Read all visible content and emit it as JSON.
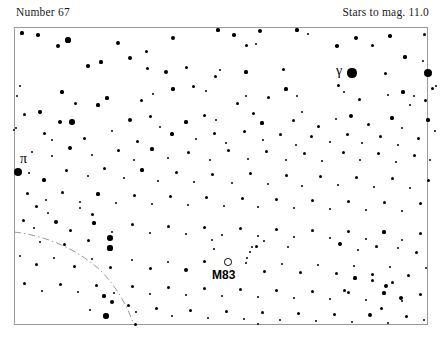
{
  "header": {
    "left": "Number 67",
    "right": "Stars to mag. 11.0"
  },
  "chart": {
    "frame": {
      "x": 14,
      "y": 27,
      "width": 414,
      "height": 298
    },
    "border_color": "#9a9a9a",
    "background": "#ffffff",
    "star_color": "#000000",
    "boundary_color": "#9a9a9a"
  },
  "labels": [
    {
      "name": "pi",
      "text": "π",
      "x": 20,
      "y": 152
    },
    {
      "name": "gamma",
      "text": "γ",
      "x": 336,
      "y": 64
    },
    {
      "name": "m83",
      "text": "M83",
      "x": 212,
      "y": 269
    }
  ],
  "deep_sky_objects": [
    {
      "name": "M83",
      "marker": "open-circle",
      "x": 228,
      "y": 262,
      "d": 7.5
    }
  ],
  "boundary_path": "M 14,232 C 48,236 78,250 100,270 C 118,288 128,308 134,325",
  "stars": [
    [
      22,
      33,
      1.6
    ],
    [
      38,
      35,
      1.7
    ],
    [
      58,
      46,
      2.3
    ],
    [
      68,
      40,
      2.6
    ],
    [
      118,
      43,
      2.0
    ],
    [
      146,
      51,
      1.5
    ],
    [
      173,
      38,
      2.1
    ],
    [
      218,
      30,
      1.6
    ],
    [
      234,
      35,
      1.7
    ],
    [
      246,
      45,
      1.5
    ],
    [
      256,
      44,
      1.3
    ],
    [
      260,
      31,
      2.4
    ],
    [
      297,
      30,
      1.6
    ],
    [
      308,
      34,
      1.4
    ],
    [
      337,
      46,
      1.8
    ],
    [
      356,
      38,
      2.0
    ],
    [
      372,
      45,
      1.5
    ],
    [
      390,
      36,
      1.8
    ],
    [
      405,
      57,
      1.6
    ],
    [
      424,
      34,
      1.5
    ],
    [
      20,
      86,
      1.4
    ],
    [
      88,
      66,
      1.8
    ],
    [
      101,
      62,
      1.6
    ],
    [
      130,
      58,
      2.0
    ],
    [
      147,
      68,
      1.5
    ],
    [
      166,
      72,
      2.2
    ],
    [
      186,
      67,
      1.5
    ],
    [
      215,
      76,
      1.5
    ],
    [
      220,
      70,
      1.3
    ],
    [
      246,
      72,
      1.6
    ],
    [
      283,
      69,
      1.5
    ],
    [
      352,
      73,
      4.6
    ],
    [
      385,
      73,
      1.5
    ],
    [
      428,
      73,
      4.3
    ],
    [
      423,
      61,
      1.4
    ],
    [
      432,
      88,
      1.5
    ],
    [
      17,
      96,
      1.4
    ],
    [
      40,
      112,
      1.7
    ],
    [
      62,
      92,
      1.6
    ],
    [
      75,
      103,
      1.5
    ],
    [
      107,
      98,
      1.6
    ],
    [
      141,
      100,
      1.5
    ],
    [
      153,
      94,
      1.4
    ],
    [
      173,
      89,
      1.6
    ],
    [
      193,
      86,
      1.5
    ],
    [
      206,
      91,
      1.4
    ],
    [
      237,
      103,
      1.5
    ],
    [
      246,
      96,
      1.3
    ],
    [
      268,
      97,
      1.5
    ],
    [
      286,
      89,
      1.6
    ],
    [
      297,
      96,
      1.4
    ],
    [
      338,
      85,
      1.5
    ],
    [
      344,
      92,
      1.4
    ],
    [
      359,
      99,
      1.5
    ],
    [
      388,
      95,
      1.4
    ],
    [
      403,
      92,
      1.6
    ],
    [
      410,
      105,
      1.4
    ],
    [
      414,
      96,
      1.3
    ],
    [
      425,
      100,
      1.5
    ],
    [
      436,
      86,
      1.4
    ],
    [
      24,
      114,
      1.5
    ],
    [
      60,
      122,
      2.4
    ],
    [
      72,
      122,
      2.8
    ],
    [
      98,
      105,
      1.6
    ],
    [
      130,
      120,
      2.3
    ],
    [
      150,
      116,
      1.5
    ],
    [
      160,
      127,
      1.4
    ],
    [
      186,
      122,
      1.6
    ],
    [
      204,
      115,
      1.5
    ],
    [
      216,
      120,
      1.4
    ],
    [
      253,
      113,
      1.5
    ],
    [
      262,
      123,
      1.6
    ],
    [
      293,
      120,
      1.5
    ],
    [
      302,
      112,
      1.4
    ],
    [
      318,
      126,
      1.5
    ],
    [
      336,
      119,
      1.4
    ],
    [
      351,
      116,
      2.0
    ],
    [
      368,
      124,
      1.5
    ],
    [
      392,
      118,
      1.6
    ],
    [
      402,
      128,
      1.4
    ],
    [
      428,
      120,
      1.6
    ],
    [
      16,
      128,
      1.4
    ],
    [
      44,
      133,
      1.5
    ],
    [
      52,
      140,
      1.3
    ],
    [
      84,
      138,
      1.5
    ],
    [
      112,
      131,
      1.4
    ],
    [
      137,
      141,
      1.5
    ],
    [
      172,
      134,
      1.6
    ],
    [
      196,
      139,
      1.4
    ],
    [
      214,
      133,
      1.5
    ],
    [
      226,
      143,
      1.3
    ],
    [
      244,
      131,
      1.5
    ],
    [
      263,
      140,
      1.4
    ],
    [
      280,
      134,
      1.5
    ],
    [
      296,
      145,
      1.4
    ],
    [
      311,
      136,
      1.5
    ],
    [
      330,
      142,
      1.4
    ],
    [
      347,
      134,
      1.5
    ],
    [
      362,
      143,
      1.4
    ],
    [
      380,
      136,
      1.5
    ],
    [
      398,
      145,
      1.4
    ],
    [
      418,
      138,
      1.5
    ],
    [
      435,
      131,
      1.4
    ],
    [
      14,
      130,
      1.4
    ],
    [
      32,
      152,
      1.4
    ],
    [
      52,
      156,
      1.3
    ],
    [
      70,
      148,
      2.2
    ],
    [
      92,
      155,
      1.4
    ],
    [
      118,
      150,
      1.5
    ],
    [
      134,
      160,
      1.4
    ],
    [
      152,
      149,
      1.6
    ],
    [
      168,
      158,
      1.4
    ],
    [
      188,
      152,
      1.5
    ],
    [
      210,
      160,
      1.4
    ],
    [
      228,
      150,
      1.5
    ],
    [
      248,
      159,
      1.4
    ],
    [
      266,
      151,
      1.5
    ],
    [
      286,
      160,
      1.4
    ],
    [
      304,
      153,
      1.5
    ],
    [
      322,
      161,
      1.4
    ],
    [
      343,
      152,
      1.5
    ],
    [
      360,
      160,
      1.4
    ],
    [
      378,
      153,
      1.5
    ],
    [
      396,
      162,
      1.4
    ],
    [
      414,
      155,
      1.5
    ],
    [
      430,
      160,
      1.4
    ],
    [
      18,
      172,
      4.4
    ],
    [
      29,
      173,
      1.3
    ],
    [
      44,
      180,
      1.6
    ],
    [
      66,
      170,
      1.5
    ],
    [
      88,
      176,
      1.4
    ],
    [
      104,
      168,
      1.5
    ],
    [
      124,
      178,
      1.4
    ],
    [
      142,
      170,
      1.6
    ],
    [
      158,
      181,
      1.4
    ],
    [
      176,
      172,
      1.5
    ],
    [
      194,
      182,
      1.4
    ],
    [
      212,
      174,
      1.5
    ],
    [
      232,
      183,
      1.4
    ],
    [
      250,
      173,
      1.5
    ],
    [
      268,
      184,
      1.4
    ],
    [
      286,
      175,
      1.5
    ],
    [
      302,
      186,
      1.4
    ],
    [
      320,
      176,
      1.5
    ],
    [
      338,
      185,
      1.4
    ],
    [
      356,
      177,
      1.5
    ],
    [
      374,
      187,
      1.4
    ],
    [
      392,
      178,
      1.5
    ],
    [
      410,
      188,
      1.4
    ],
    [
      428,
      180,
      1.5
    ],
    [
      27,
      193,
      1.5
    ],
    [
      46,
      200,
      1.4
    ],
    [
      62,
      192,
      1.5
    ],
    [
      80,
      202,
      1.4
    ],
    [
      98,
      194,
      1.6
    ],
    [
      116,
      203,
      1.4
    ],
    [
      134,
      195,
      1.5
    ],
    [
      152,
      204,
      1.4
    ],
    [
      170,
      196,
      1.5
    ],
    [
      188,
      205,
      1.4
    ],
    [
      206,
      197,
      1.5
    ],
    [
      224,
      206,
      1.4
    ],
    [
      242,
      198,
      1.5
    ],
    [
      258,
      207,
      1.4
    ],
    [
      276,
      199,
      1.5
    ],
    [
      294,
      208,
      1.4
    ],
    [
      312,
      200,
      1.5
    ],
    [
      330,
      209,
      1.4
    ],
    [
      348,
      201,
      1.5
    ],
    [
      366,
      210,
      1.4
    ],
    [
      384,
      202,
      1.5
    ],
    [
      402,
      211,
      1.4
    ],
    [
      420,
      203,
      1.5
    ],
    [
      23,
      220,
      1.5
    ],
    [
      34,
      228,
      1.4
    ],
    [
      56,
      222,
      2.2
    ],
    [
      70,
      230,
      1.5
    ],
    [
      94,
      223,
      1.6
    ],
    [
      112,
      232,
      1.4
    ],
    [
      132,
      224,
      1.5
    ],
    [
      150,
      233,
      1.4
    ],
    [
      168,
      226,
      1.5
    ],
    [
      186,
      234,
      1.4
    ],
    [
      204,
      227,
      1.5
    ],
    [
      222,
      235,
      1.4
    ],
    [
      240,
      228,
      1.5
    ],
    [
      258,
      236,
      1.4
    ],
    [
      276,
      229,
      1.5
    ],
    [
      294,
      237,
      1.4
    ],
    [
      312,
      230,
      1.5
    ],
    [
      330,
      238,
      1.4
    ],
    [
      348,
      231,
      1.5
    ],
    [
      366,
      239,
      1.4
    ],
    [
      384,
      232,
      1.6
    ],
    [
      402,
      240,
      1.4
    ],
    [
      420,
      233,
      1.5
    ],
    [
      110,
      238,
      2.8
    ],
    [
      110,
      248,
      2.6
    ],
    [
      88,
      240,
      1.5
    ],
    [
      64,
      244,
      1.5
    ],
    [
      40,
      242,
      1.4
    ],
    [
      212,
      240,
      1.4
    ],
    [
      214,
      249,
      1.3
    ],
    [
      256,
      246,
      1.5
    ],
    [
      264,
      241,
      1.3
    ],
    [
      288,
      247,
      1.4
    ],
    [
      340,
      244,
      2.3
    ],
    [
      358,
      250,
      1.4
    ],
    [
      376,
      246,
      1.5
    ],
    [
      398,
      248,
      1.4
    ],
    [
      416,
      252,
      1.5
    ],
    [
      20,
      256,
      1.4
    ],
    [
      36,
      264,
      1.5
    ],
    [
      54,
      258,
      1.4
    ],
    [
      74,
      266,
      1.5
    ],
    [
      92,
      259,
      1.4
    ],
    [
      110,
      267,
      1.5
    ],
    [
      132,
      260,
      1.4
    ],
    [
      150,
      268,
      1.5
    ],
    [
      168,
      262,
      1.4
    ],
    [
      186,
      270,
      2.0
    ],
    [
      204,
      261,
      1.5
    ],
    [
      246,
      263,
      1.4
    ],
    [
      264,
      271,
      1.5
    ],
    [
      282,
      264,
      1.4
    ],
    [
      300,
      272,
      1.5
    ],
    [
      318,
      265,
      1.4
    ],
    [
      336,
      273,
      1.5
    ],
    [
      354,
      266,
      1.4
    ],
    [
      372,
      274,
      1.5
    ],
    [
      390,
      267,
      1.4
    ],
    [
      408,
      275,
      1.5
    ],
    [
      426,
      268,
      1.4
    ],
    [
      247,
      258,
      1.3
    ],
    [
      250,
      252,
      1.3
    ],
    [
      252,
      247,
      1.2
    ],
    [
      24,
      283,
      1.5
    ],
    [
      42,
      291,
      1.4
    ],
    [
      60,
      284,
      1.5
    ],
    [
      78,
      292,
      1.4
    ],
    [
      96,
      285,
      1.5
    ],
    [
      114,
      293,
      1.4
    ],
    [
      132,
      286,
      1.5
    ],
    [
      150,
      294,
      1.4
    ],
    [
      168,
      287,
      1.5
    ],
    [
      186,
      295,
      1.4
    ],
    [
      204,
      288,
      1.5
    ],
    [
      222,
      296,
      1.4
    ],
    [
      240,
      289,
      1.5
    ],
    [
      258,
      297,
      1.4
    ],
    [
      276,
      290,
      1.5
    ],
    [
      294,
      298,
      1.4
    ],
    [
      312,
      291,
      1.5
    ],
    [
      330,
      299,
      1.4
    ],
    [
      348,
      292,
      1.5
    ],
    [
      366,
      300,
      1.4
    ],
    [
      384,
      293,
      1.6
    ],
    [
      402,
      301,
      1.4
    ],
    [
      420,
      294,
      1.5
    ],
    [
      104,
      296,
      1.6
    ],
    [
      112,
      302,
      2.3
    ],
    [
      128,
      305,
      1.5
    ],
    [
      90,
      310,
      1.4
    ],
    [
      106,
      316,
      2.7
    ],
    [
      136,
      312,
      1.4
    ],
    [
      156,
      308,
      1.5
    ],
    [
      172,
      316,
      1.4
    ],
    [
      190,
      310,
      1.5
    ],
    [
      208,
      318,
      1.4
    ],
    [
      226,
      311,
      1.5
    ],
    [
      244,
      319,
      1.4
    ],
    [
      262,
      312,
      1.5
    ],
    [
      280,
      320,
      1.4
    ],
    [
      298,
      313,
      1.5
    ],
    [
      316,
      321,
      1.4
    ],
    [
      334,
      314,
      1.5
    ],
    [
      352,
      322,
      1.4
    ],
    [
      370,
      315,
      2.4
    ],
    [
      388,
      323,
      1.4
    ],
    [
      406,
      316,
      1.5
    ],
    [
      424,
      320,
      1.4
    ],
    [
      135,
      324,
      1.5
    ],
    [
      258,
      324,
      1.4
    ],
    [
      381,
      308,
      1.5
    ],
    [
      401,
      298,
      2.2
    ],
    [
      386,
      286,
      2.2
    ],
    [
      392,
      282,
      1.5
    ],
    [
      372,
      280,
      1.5
    ],
    [
      355,
      278,
      1.6
    ],
    [
      344,
      290,
      1.5
    ],
    [
      36,
      206,
      1.5
    ],
    [
      48,
      213,
      1.4
    ],
    [
      92,
      214,
      1.5
    ],
    [
      80,
      208,
      1.4
    ]
  ]
}
